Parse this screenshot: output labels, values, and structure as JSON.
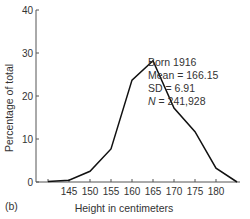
{
  "chart_data": {
    "type": "line",
    "panel_label": "(b)",
    "title": "",
    "xlabel": "Height in centimeters",
    "ylabel": "Percentage of total",
    "xlim": [
      137,
      186
    ],
    "ylim": [
      0,
      40
    ],
    "x_ticks": [
      145,
      150,
      155,
      160,
      165,
      170,
      175,
      180
    ],
    "y_ticks": [
      0,
      10,
      20,
      30,
      40
    ],
    "grid": false,
    "x": [
      140,
      145,
      150,
      155,
      160,
      165,
      170,
      175,
      180,
      185
    ],
    "series": [
      {
        "name": "Born 1916",
        "values": [
          0.1,
          0.4,
          2.5,
          7.7,
          23.7,
          28.2,
          17.2,
          11.7,
          3.2,
          0.0
        ]
      }
    ],
    "annotations": [
      "Born 1916",
      "Mean = 166.15",
      "SD = 6.91",
      "N = 241,928"
    ]
  },
  "annotation": {
    "line1": "Born 1916",
    "line2": "Mean = 166.15",
    "line3": "SD = 6.91",
    "line4_prefix": "N",
    "line4_value": " = 241,928"
  }
}
